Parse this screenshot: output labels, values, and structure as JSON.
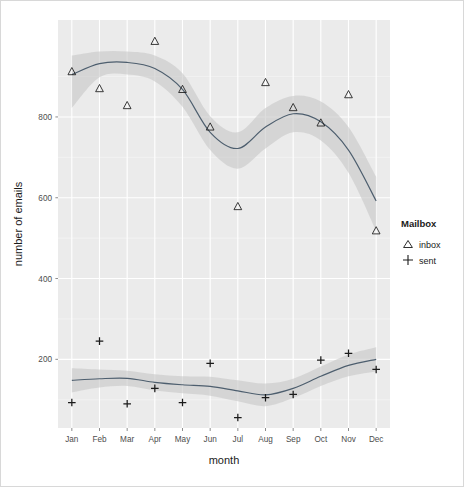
{
  "chart_data": {
    "type": "scatter",
    "title": "",
    "subtitle": "",
    "xlabel": "month",
    "ylabel": "number of emails",
    "categories": [
      "Jan",
      "Feb",
      "Mar",
      "Apr",
      "May",
      "Jun",
      "Jul",
      "Aug",
      "Sep",
      "Oct",
      "Nov",
      "Dec"
    ],
    "x_tick_labels": [
      "Jan",
      "Feb",
      "Mar",
      "Apr",
      "May",
      "Jun",
      "Jul",
      "Aug",
      "Sep",
      "Oct",
      "Nov",
      "Dec"
    ],
    "y_tick_labels": [
      "800",
      "600",
      "400",
      "200"
    ],
    "y_ticks": [
      800,
      600,
      400,
      200
    ],
    "ylim": [
      30,
      1040
    ],
    "grid": true,
    "legend_position": "right",
    "legend_title": "Mailbox",
    "series": [
      {
        "name": "inbox",
        "marker": "triangle",
        "values": [
          912,
          870,
          828,
          987,
          868,
          775,
          578,
          885,
          823,
          785,
          855,
          518
        ],
        "smooth_line": [
          905,
          932,
          935,
          920,
          868,
          762,
          722,
          775,
          808,
          788,
          718,
          592
        ],
        "smooth_upper": [
          952,
          962,
          962,
          952,
          908,
          802,
          762,
          822,
          852,
          838,
          775,
          652
        ],
        "smooth_lower": [
          822,
          898,
          905,
          888,
          825,
          718,
          672,
          722,
          762,
          742,
          662,
          518
        ]
      },
      {
        "name": "sent",
        "marker": "plus",
        "values": [
          93,
          245,
          90,
          128,
          93,
          190,
          56,
          105,
          113,
          198,
          215,
          175
        ],
        "smooth_line": [
          148,
          152,
          153,
          143,
          137,
          133,
          122,
          112,
          128,
          158,
          185,
          200
        ],
        "smooth_upper": [
          178,
          175,
          172,
          163,
          158,
          157,
          148,
          140,
          152,
          182,
          212,
          230
        ],
        "smooth_lower": [
          118,
          130,
          134,
          123,
          116,
          110,
          96,
          84,
          104,
          134,
          158,
          170
        ]
      }
    ]
  },
  "legend": {
    "title": "Mailbox",
    "items": [
      {
        "label": "inbox",
        "marker": "triangle"
      },
      {
        "label": "sent",
        "marker": "plus"
      }
    ]
  },
  "axes": {
    "x_title": "month",
    "y_title": "number of emails"
  },
  "colors": {
    "panel_background": "#ebebeb",
    "grid_major": "#ffffff",
    "grid_minor": "#f7f7f7",
    "line": "#4d5e6e",
    "ribbon": "#c8c8c8",
    "marker": "#1a1a1a",
    "text": "#1a1a1a",
    "tick_text": "#4d4d4d"
  }
}
